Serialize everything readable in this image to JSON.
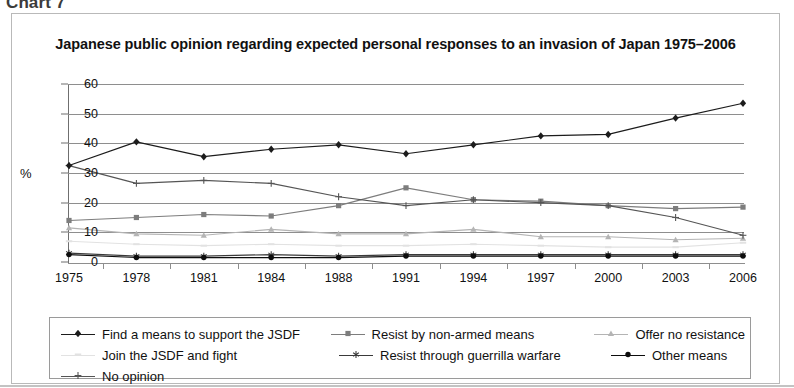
{
  "figure_label": "Chart 7",
  "title": "Japanese public opinion regarding expected personal responses to an invasion of Japan 1975–2006",
  "axes": {
    "y_axis_title": "%",
    "y_ticks": [
      "60",
      "50",
      "40",
      "30",
      "20",
      "10",
      "0"
    ],
    "x_ticks": [
      "1975",
      "1978",
      "1981",
      "1984",
      "1988",
      "1991",
      "1994",
      "1997",
      "2000",
      "2003",
      "2006"
    ]
  },
  "legend": {
    "items": [
      {
        "label": "Find a means to support the JSDF",
        "marker": "diamond",
        "color": "#1c1c1c"
      },
      {
        "label": "Resist by non-armed means",
        "marker": "square",
        "color": "#7d7d7d"
      },
      {
        "label": "Offer no resistance",
        "marker": "triangle",
        "color": "#b4b4b4"
      },
      {
        "label": "Join the JSDF and fight",
        "marker": "dash",
        "color": "#e2e2e2"
      },
      {
        "label": "Resist through guerrilla warfare",
        "marker": "star",
        "color": "#3a3a3a"
      },
      {
        "label": "Other means",
        "marker": "circle",
        "color": "#0d0d0d"
      },
      {
        "label": "No opinion",
        "marker": "plus",
        "color": "#555555"
      }
    ]
  },
  "chart_data": {
    "type": "line",
    "title": "Japanese public opinion regarding expected personal responses to an invasion of Japan 1975–2006",
    "xlabel": "",
    "ylabel": "%",
    "ylim": [
      0,
      60
    ],
    "ytick_step": 10,
    "grid": true,
    "legend_position": "bottom",
    "categories": [
      "1975",
      "1978",
      "1981",
      "1984",
      "1988",
      "1991",
      "1994",
      "1997",
      "2000",
      "2003",
      "2006"
    ],
    "series": [
      {
        "name": "Find a means to support the JSDF",
        "color": "#1c1c1c",
        "marker": "diamond",
        "values": [
          32.5,
          40.5,
          35.5,
          38,
          39.5,
          36.5,
          39.5,
          42.5,
          43,
          48.5,
          53.5
        ]
      },
      {
        "name": "Resist by non-armed means",
        "color": "#7d7d7d",
        "marker": "square",
        "values": [
          14,
          15,
          16,
          15.5,
          19,
          25,
          21,
          20.5,
          19,
          18,
          18.5
        ]
      },
      {
        "name": "Offer no resistance",
        "color": "#b4b4b4",
        "marker": "triangle",
        "values": [
          11.5,
          9.5,
          9,
          11,
          9.5,
          9.5,
          11,
          8.5,
          8.5,
          7.5,
          8
        ]
      },
      {
        "name": "Join the JSDF and fight",
        "color": "#e2e2e2",
        "marker": "dash",
        "values": [
          7,
          6,
          5.5,
          6,
          5.5,
          5.5,
          6,
          5.5,
          5,
          5,
          6.5
        ]
      },
      {
        "name": "Resist through guerrilla warfare",
        "color": "#3a3a3a",
        "marker": "star",
        "values": [
          3,
          2,
          2,
          2.5,
          2,
          2.5,
          2.5,
          2.5,
          2.5,
          2.5,
          2.5
        ]
      },
      {
        "name": "Other means",
        "color": "#0d0d0d",
        "marker": "circle",
        "values": [
          2.5,
          1.5,
          1.5,
          1.5,
          1.5,
          2,
          2,
          2,
          2,
          2,
          2
        ]
      },
      {
        "name": "No opinion",
        "color": "#555555",
        "marker": "plus",
        "values": [
          32.5,
          26.5,
          27.5,
          26.5,
          22,
          19,
          21,
          20,
          19,
          15,
          9
        ]
      }
    ]
  }
}
